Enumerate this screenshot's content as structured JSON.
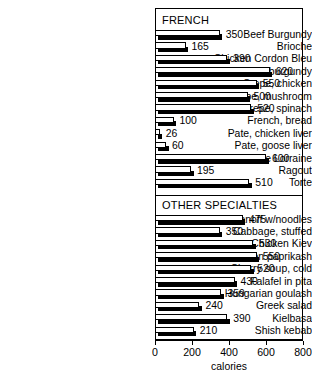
{
  "chart_data": {
    "type": "bar",
    "orientation": "horizontal",
    "title": "",
    "xlabel": "calories",
    "ylabel": "",
    "xlim": [
      0,
      800
    ],
    "xticks": [
      0,
      200,
      400,
      600,
      800
    ],
    "grid": false,
    "legend": null,
    "groups": [
      {
        "name": "FRENCH",
        "categories": [
          "Beef Burgundy",
          "Brioche",
          "Chicken Cordon Bleu",
          "Crepe, beef burgundy",
          "Crepe, chicken",
          "Crepe, mushroom",
          "Crepe, spinach",
          "French, bread",
          "Pate, chicken liver",
          "Pate, goose liver",
          "Quiche Lorraine",
          "Ragout",
          "Torte"
        ],
        "values": [
          350,
          165,
          390,
          620,
          550,
          500,
          520,
          100,
          26,
          60,
          600,
          195,
          510
        ]
      },
      {
        "name": "OTHER SPECIALTIES",
        "categories": [
          "Beef Stroganoff w/noodles",
          "Cabbage, stuffed",
          "Chicken Kiev",
          "Chicken paprikash",
          "Cherry soup, cold",
          "Falafel in pita",
          "Hungarian goulash",
          "Greek salad",
          "Kielbasa",
          "Shish kebab"
        ],
        "values": [
          475,
          350,
          530,
          550,
          520,
          430,
          359,
          240,
          390,
          210
        ]
      }
    ],
    "colors": {
      "bar_face": "#ffffff",
      "bar_shadow": "#000000",
      "outline": "#000000",
      "background": "#ffffff"
    }
  }
}
